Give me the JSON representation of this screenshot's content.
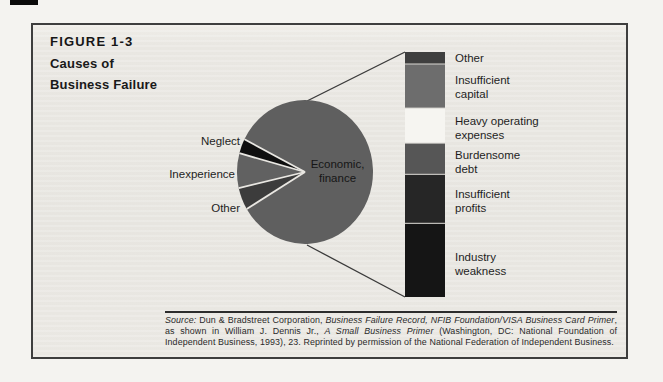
{
  "figure": {
    "label": "FIGURE 1-3",
    "title_lines": [
      "Causes of",
      "Business Failure"
    ]
  },
  "chart_data": {
    "type": "pie",
    "title": "Causes of Business Failure",
    "legend_position": "none",
    "pie": {
      "start_angle_deg": 153,
      "direction": "ccw",
      "inside_label_lines": [
        "Economic,",
        "finance"
      ],
      "slices": [
        {
          "label": "Neglect",
          "percent": 3.3,
          "color": "#0f0f0f"
        },
        {
          "label": "Inexperience",
          "percent": 7.8,
          "color": "#616161"
        },
        {
          "label": "Other",
          "percent": 5.0,
          "color": "#3c3c3c"
        },
        {
          "label": "Economic, finance",
          "percent": 83.9,
          "color": "#5f5f5f"
        }
      ]
    },
    "breakdown_bar": {
      "describes": "Economic, finance",
      "segments": [
        {
          "label": "Other",
          "percent_of_bar": 4.9,
          "color": "#3f3f3f"
        },
        {
          "label": "Insufficient capital",
          "percent_of_bar": 18.0,
          "color": "#6d6d6d"
        },
        {
          "label": "Heavy operating expenses",
          "percent_of_bar": 14.3,
          "color": "#f6f5f1"
        },
        {
          "label": "Burdensome debt",
          "percent_of_bar": 12.7,
          "color": "#565656"
        },
        {
          "label": "Insufficient profits",
          "percent_of_bar": 20.0,
          "color": "#262626"
        },
        {
          "label": "Industry weakness",
          "percent_of_bar": 30.1,
          "color": "#151515"
        }
      ]
    }
  },
  "colors": {
    "figure_background": "#e7e5e0",
    "figure_border": "#3e3e3e",
    "slice_separator": "#e9e7e2",
    "connector_line": "#3a3a3a"
  },
  "source": {
    "segments": [
      {
        "text": "Source: ",
        "italic": true
      },
      {
        "text": "Dun & Bradstreet Corporation, ",
        "italic": false
      },
      {
        "text": "Business Failure Record, NFIB Foundation/VISA Business Card Primer",
        "italic": true
      },
      {
        "text": ", as shown in William J. Dennis Jr., ",
        "italic": false
      },
      {
        "text": "A Small Business Primer",
        "italic": true
      },
      {
        "text": " (Washington, DC: National Foundation of Independent Business, 1993), 23. Reprinted by permission of the National Federation of Independent Business.",
        "italic": false
      }
    ]
  }
}
